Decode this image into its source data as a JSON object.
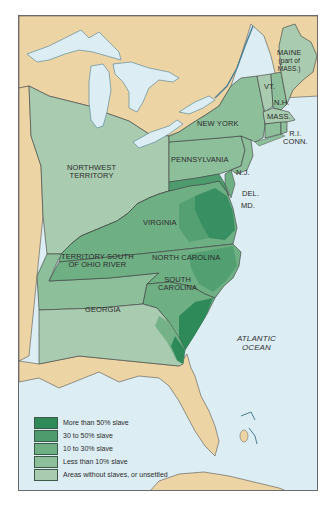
{
  "map": {
    "title_visible": false,
    "colors": {
      "ocean": "#dcedf3",
      "foreign_land": "#ecd4a4",
      "border": "#3a3a3a",
      "unsettled": "#a9cbb0",
      "less_than_10": "#8dbf9b",
      "ten_to_30": "#6faf84",
      "thirty_to_50": "#4e9c6e",
      "more_than_50": "#2f8a5a"
    },
    "labels": {
      "maine": "MAINE",
      "maine_sub1": "(part of",
      "maine_sub2": "MASS.)",
      "vt": "VT.",
      "nh": "N.H.",
      "mass": "MASS.",
      "ri": "R.I.",
      "conn": "CONN.",
      "new_york": "NEW YORK",
      "pennsylvania": "PENNSYLVANIA",
      "nj": "N.J.",
      "del": "DEL.",
      "md": "MD.",
      "northwest1": "NORTHWEST",
      "northwest2": "TERRITORY",
      "virginia": "VIRGINIA",
      "tsor1": "TERRITORY SOUTH",
      "tsor2": "OF OHIO RIVER",
      "north_carolina": "NORTH CAROLINA",
      "south_carolina1": "SOUTH",
      "south_carolina2": "CAROLINA",
      "georgia": "GEORGIA",
      "atlantic1": "ATLANTIC",
      "atlantic2": "OCEAN"
    },
    "legend": [
      {
        "label": "More than 50% slave",
        "color": "#2f8a5a"
      },
      {
        "label": "30 to 50% slave",
        "color": "#4e9c6e"
      },
      {
        "label": "10 to 30% slave",
        "color": "#6faf84"
      },
      {
        "label": "Less than 10% slave",
        "color": "#8dbf9b"
      },
      {
        "label": "Areas without slaves, or unsettled",
        "color": "#a9cbb0"
      }
    ]
  }
}
